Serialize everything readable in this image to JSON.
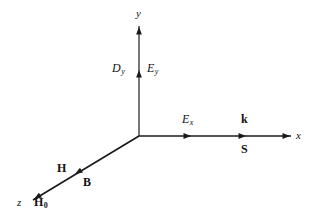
{
  "figure": {
    "background_color": "#ffffff",
    "line_color": "#1a1a1a",
    "text_color": "#111111",
    "width": 312,
    "height": 222
  },
  "axes": {
    "origin": {
      "x": 139,
      "y": 136
    },
    "items": [
      {
        "id": "y",
        "label": "y",
        "label_pos": {
          "x": 136,
          "y": 8
        },
        "from": {
          "x": 139,
          "y": 136
        },
        "to": {
          "x": 139,
          "y": 26
        },
        "direction": "up",
        "stroke_width": 1.2
      },
      {
        "id": "x",
        "label": "x",
        "label_pos": {
          "x": 296,
          "y": 130
        },
        "from": {
          "x": 139,
          "y": 136
        },
        "to": {
          "x": 291,
          "y": 136
        },
        "direction": "right",
        "stroke_width": 1.3
      },
      {
        "id": "z",
        "label": "z",
        "label_pos": {
          "x": 17,
          "y": 197
        },
        "from": {
          "x": 139,
          "y": 136
        },
        "to": {
          "x": 33,
          "y": 200
        },
        "direction": "down-left",
        "stroke_width": 1.7
      }
    ]
  },
  "arrowheads": [
    {
      "id": "y-axis-tip",
      "on_axis": "y",
      "x": 139,
      "y": 27,
      "angle_deg": -90
    },
    {
      "id": "ey-mid",
      "on_axis": "y",
      "x": 139,
      "y": 70,
      "angle_deg": -90
    },
    {
      "id": "x-axis-tip",
      "on_axis": "x",
      "x": 290,
      "y": 136,
      "angle_deg": 0
    },
    {
      "id": "ex-mid",
      "on_axis": "x",
      "x": 191,
      "y": 136,
      "angle_deg": 0
    },
    {
      "id": "k-s-mid",
      "on_axis": "x",
      "x": 246,
      "y": 136,
      "angle_deg": 0
    },
    {
      "id": "z-axis-tip",
      "on_axis": "z",
      "x": 34,
      "y": 199,
      "angle_deg": 149
    },
    {
      "id": "h-b-mid",
      "on_axis": "z",
      "x": 75,
      "y": 174,
      "angle_deg": 149
    }
  ],
  "labels": [
    {
      "id": "label-Dy",
      "name": "electric-displacement-y",
      "base": "D",
      "sub": "y",
      "style": "italic",
      "pos": {
        "x": 112,
        "y": 62
      }
    },
    {
      "id": "label-Ey",
      "name": "electric-field-y",
      "base": "E",
      "sub": "y",
      "style": "italic",
      "pos": {
        "x": 147,
        "y": 62
      }
    },
    {
      "id": "label-Ex",
      "name": "electric-field-x",
      "base": "E",
      "sub": "x",
      "style": "italic",
      "pos": {
        "x": 182,
        "y": 113
      }
    },
    {
      "id": "label-k",
      "name": "wave-vector",
      "base": "k",
      "sub": "",
      "style": "bold",
      "pos": {
        "x": 241,
        "y": 113
      }
    },
    {
      "id": "label-S",
      "name": "poynting-vector",
      "base": "S",
      "sub": "",
      "style": "bold",
      "pos": {
        "x": 241,
        "y": 143
      }
    },
    {
      "id": "label-H",
      "name": "magnetic-field-h",
      "base": "H",
      "sub": "",
      "style": "bold",
      "pos": {
        "x": 57,
        "y": 162
      }
    },
    {
      "id": "label-B",
      "name": "magnetic-flux-density",
      "base": "B",
      "sub": "",
      "style": "bold",
      "pos": {
        "x": 83,
        "y": 176
      }
    },
    {
      "id": "label-H0",
      "name": "static-magnetic-field",
      "base": "H",
      "sub": "0",
      "style": "bold",
      "pos": {
        "x": 34,
        "y": 196
      }
    }
  ]
}
